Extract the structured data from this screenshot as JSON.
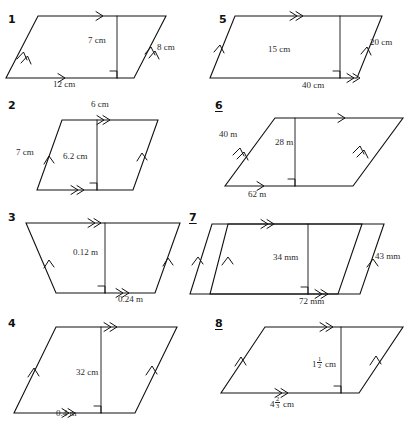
{
  "worksheet": {
    "title": "Parallelogram measurements worksheet",
    "units_used": [
      "cm",
      "m",
      "mm"
    ],
    "figure_count": 8,
    "columns": 2
  },
  "figures": [
    {
      "number": "1",
      "underlined": false,
      "shape": "parallelogram",
      "labels": {
        "height": "7 cm",
        "base": "12 cm",
        "side": "8 cm"
      },
      "marks": {
        "base_arrow": "single",
        "top_arrow": "single",
        "left_side_arrow": "double",
        "right_side_arrow": "double",
        "right_angle": true
      }
    },
    {
      "number": "2",
      "underlined": false,
      "shape": "parallelogram",
      "labels": {
        "height": "6.2 cm",
        "base": "6 cm",
        "side": "7 cm"
      },
      "marks": {
        "base_arrow": "double",
        "top_arrow": "double",
        "left_side_arrow": "single",
        "right_side_arrow": "single",
        "right_angle": true
      }
    },
    {
      "number": "3",
      "underlined": false,
      "shape": "parallelogram",
      "labels": {
        "height": "0.12 m",
        "base": "0.24 m",
        "side": ""
      },
      "marks": {
        "base_arrow": "double",
        "top_arrow": "double",
        "left_side_arrow": "single",
        "right_side_arrow": "single",
        "right_angle": true
      }
    },
    {
      "number": "4",
      "underlined": false,
      "shape": "parallelogram",
      "labels": {
        "height": "32 cm",
        "base": "0.4 m",
        "side": ""
      },
      "marks": {
        "base_arrow": "double",
        "top_arrow": "double",
        "left_side_arrow": "single",
        "right_side_arrow": "single",
        "right_angle": true
      }
    },
    {
      "number": "5",
      "underlined": false,
      "shape": "parallelogram",
      "labels": {
        "height": "15 cm",
        "base": "40 cm",
        "side": "20 cm"
      },
      "marks": {
        "base_arrow": "double",
        "top_arrow": "double",
        "left_side_arrow": "single",
        "right_side_arrow": "single",
        "right_angle": true
      }
    },
    {
      "number": "6",
      "underlined": true,
      "shape": "parallelogram",
      "labels": {
        "height": "28 m",
        "base": "62 m",
        "side": "40 m"
      },
      "marks": {
        "base_arrow": "single",
        "top_arrow": "single",
        "left_side_arrow": "double",
        "right_side_arrow": "double",
        "right_angle": true
      }
    },
    {
      "number": "7",
      "underlined": true,
      "shape": "parallelogram",
      "labels": {
        "height": "34 mm",
        "base": "72 mm",
        "side": "43 mm"
      },
      "marks": {
        "base_arrow": "double",
        "top_arrow": "double",
        "left_side_arrow": "single",
        "right_side_arrow": "single",
        "right_angle": true
      }
    },
    {
      "number": "8",
      "underlined": true,
      "shape": "parallelogram",
      "labels": {
        "height_whole": "1",
        "height_num": "1",
        "height_den": "2",
        "height_unit": "cm",
        "base_whole": "4",
        "base_num": "2",
        "base_den": "3",
        "base_unit": "cm",
        "side": ""
      },
      "marks": {
        "base_arrow": "double",
        "top_arrow": "double",
        "left_side_arrow": "single",
        "right_side_arrow": "single",
        "right_angle": true
      }
    }
  ],
  "colors": {
    "ink": "#111111",
    "label_ink": "#2b2b2b",
    "paper": "#ffffff"
  }
}
